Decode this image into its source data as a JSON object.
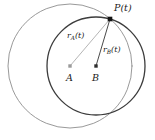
{
  "figure": {
    "width": 155,
    "height": 140,
    "background": "#ffffff"
  },
  "labels": {
    "point_p": "P(t)",
    "radius_a_base": "r",
    "radius_a_sub": "A",
    "radius_a_arg": "(t)",
    "radius_b_base": "r",
    "radius_b_sub": "B",
    "radius_b_arg": "(t)",
    "center_a": "A",
    "center_b": "B"
  },
  "colors": {
    "circle_a_stroke": "#8d8d8d",
    "circle_b_stroke": "#3c3c3c",
    "radius_a_stroke": "#a8a8a8",
    "radius_b_stroke": "#4a4a4a",
    "point_marker": "#141414",
    "center_a_marker": "#9a9a9a",
    "center_b_marker": "#2e2e2e",
    "text": "#1a1a1a",
    "background": "#ffffff"
  },
  "geometry": {
    "circle_a": {
      "cx": 70,
      "cy": 66,
      "r": 62,
      "stroke_width": 0.9
    },
    "circle_b": {
      "cx": 96,
      "cy": 66,
      "r": 49,
      "stroke_width": 1.3
    },
    "point_p": {
      "x": 110,
      "y": 19,
      "marker_size": 4.6
    },
    "center_a": {
      "x": 70,
      "y": 66,
      "marker_size": 3.4
    },
    "center_b": {
      "x": 96,
      "y": 66,
      "marker_size": 3.4
    },
    "segment_a": {
      "x1": 70,
      "y1": 66,
      "x2": 110,
      "y2": 19,
      "stroke_width": 0.85
    },
    "segment_b": {
      "x1": 96,
      "y1": 66,
      "x2": 110,
      "y2": 19,
      "stroke_width": 1.0
    }
  }
}
